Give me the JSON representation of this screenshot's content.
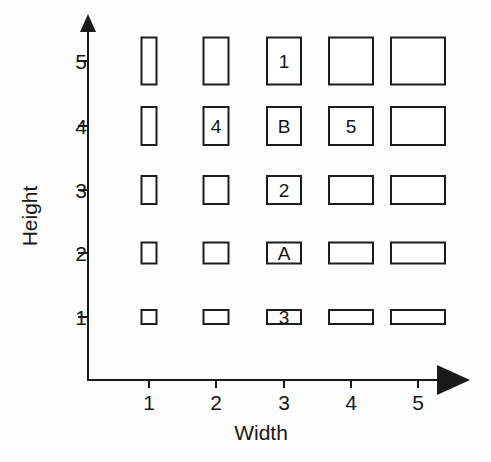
{
  "chart_data": {
    "type": "scatter",
    "title": "",
    "xlabel": "Width",
    "ylabel": "Height",
    "x_ticks": [
      "1",
      "2",
      "3",
      "4",
      "5"
    ],
    "y_ticks": [
      "1",
      "2",
      "3",
      "4",
      "5"
    ],
    "xlim": [
      0,
      5.6
    ],
    "ylim": [
      0,
      5.6
    ],
    "grid": false,
    "legend": null,
    "x_axis_arrow": true,
    "y_axis_arrow": true,
    "rect_width_by_column": [
      17,
      27,
      36,
      46,
      56
    ],
    "rect_height_by_row": [
      16,
      23,
      30,
      40,
      49
    ],
    "cells": [
      {
        "width": 1,
        "height": 5,
        "label": ""
      },
      {
        "width": 2,
        "height": 5,
        "label": ""
      },
      {
        "width": 3,
        "height": 5,
        "label": "1"
      },
      {
        "width": 4,
        "height": 5,
        "label": ""
      },
      {
        "width": 5,
        "height": 5,
        "label": ""
      },
      {
        "width": 1,
        "height": 4,
        "label": ""
      },
      {
        "width": 2,
        "height": 4,
        "label": "4"
      },
      {
        "width": 3,
        "height": 4,
        "label": "B"
      },
      {
        "width": 4,
        "height": 4,
        "label": "5"
      },
      {
        "width": 5,
        "height": 4,
        "label": ""
      },
      {
        "width": 1,
        "height": 3,
        "label": ""
      },
      {
        "width": 2,
        "height": 3,
        "label": ""
      },
      {
        "width": 3,
        "height": 3,
        "label": "2"
      },
      {
        "width": 4,
        "height": 3,
        "label": ""
      },
      {
        "width": 5,
        "height": 3,
        "label": ""
      },
      {
        "width": 1,
        "height": 2,
        "label": ""
      },
      {
        "width": 2,
        "height": 2,
        "label": ""
      },
      {
        "width": 3,
        "height": 2,
        "label": "A"
      },
      {
        "width": 4,
        "height": 2,
        "label": ""
      },
      {
        "width": 5,
        "height": 2,
        "label": ""
      },
      {
        "width": 1,
        "height": 1,
        "label": ""
      },
      {
        "width": 2,
        "height": 1,
        "label": ""
      },
      {
        "width": 3,
        "height": 1,
        "label": "3"
      },
      {
        "width": 4,
        "height": 1,
        "label": ""
      },
      {
        "width": 5,
        "height": 1,
        "label": ""
      }
    ],
    "labeled_points": [
      {
        "label": "1",
        "width": 3,
        "height": 5
      },
      {
        "label": "4",
        "width": 2,
        "height": 4
      },
      {
        "label": "B",
        "width": 3,
        "height": 4
      },
      {
        "label": "5",
        "width": 4,
        "height": 4
      },
      {
        "label": "2",
        "width": 3,
        "height": 3
      },
      {
        "label": "A",
        "width": 3,
        "height": 2
      },
      {
        "label": "3",
        "width": 3,
        "height": 1
      }
    ],
    "colors": {
      "stroke": "#1c1c1c",
      "fill": "#ffffff",
      "axis": "#1a1a1a",
      "text": "#171717",
      "background": "#fdfdfd"
    }
  },
  "geometry": {
    "x_tick_px": [
      149,
      216,
      284,
      351,
      418
    ],
    "y_tick_px": [
      317,
      253,
      190,
      126,
      61
    ]
  }
}
